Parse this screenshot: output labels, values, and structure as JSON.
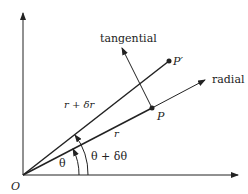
{
  "labels": {
    "tangential": "tangential",
    "radial": "radial",
    "p_prime": "P′",
    "p": "P",
    "r_plus_dr": "r + δr",
    "r": "r",
    "theta": "θ",
    "theta_plus_dtheta": "θ + δθ",
    "origin": "O"
  },
  "colors": {
    "line": "#222222",
    "background": "#ffffff"
  }
}
